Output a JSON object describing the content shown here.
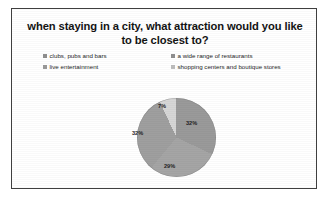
{
  "slide": {
    "title": "when staying in a city, what attraction would you like to be closest to?"
  },
  "chart_data": {
    "type": "pie",
    "title": "when staying in a city, what attraction would you like to be closest to?",
    "categories": [
      "clubs, pubs and bars",
      "a wide range of restaurants",
      "live entertainment",
      "shopping centers and boutique stores"
    ],
    "values": [
      32,
      29,
      32,
      7
    ],
    "labels": [
      "32%",
      "29%",
      "32%",
      "7%"
    ],
    "colors": [
      "#9a9a9a",
      "#a5a5a5",
      "#9f9f9f",
      "#d6d6d6"
    ],
    "legend_position": "top",
    "legend": [
      {
        "label": "clubs, pubs and bars",
        "color": "#8f8f8f",
        "row": 0,
        "col": 0
      },
      {
        "label": "a wide range of restaurants",
        "color": "#8f8f8f",
        "row": 0,
        "col": 1
      },
      {
        "label": "live entertainment",
        "color": "#9a9a9a",
        "row": 1,
        "col": 0
      },
      {
        "label": "shopping centers and boutique stores",
        "color": "#bdbdbd",
        "row": 1,
        "col": 1
      }
    ],
    "slice_order_clockwise_from_12": [
      {
        "label": "32%",
        "value": 32
      },
      {
        "label": "29%",
        "value": 29
      },
      {
        "label": "32%",
        "value": 32
      },
      {
        "label": "7%",
        "value": 7
      }
    ]
  }
}
